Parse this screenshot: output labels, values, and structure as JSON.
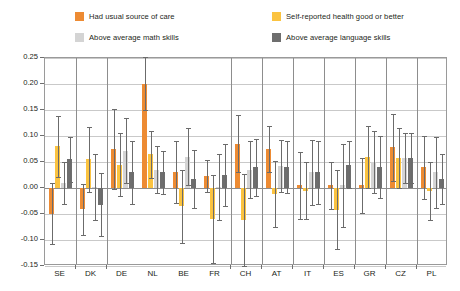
{
  "legend": {
    "rows": [
      [
        {
          "label": "Had usual source of care",
          "color": "#ED8B33",
          "icon": "legend-swatch-orange"
        },
        {
          "label": "Self-reported health good or better",
          "color": "#FBC340",
          "icon": "legend-swatch-yellow"
        }
      ],
      [
        {
          "label": "Above average math skills",
          "color": "#D4D4D4",
          "icon": "legend-swatch-light-gray"
        },
        {
          "label": "Above average language skills",
          "color": "#6E6E6E",
          "icon": "legend-swatch-dark-gray"
        }
      ]
    ]
  },
  "chart_data": {
    "type": "bar",
    "title": "",
    "subtitle": "",
    "xlabel": "",
    "ylabel": "",
    "ylim": [
      -0.15,
      0.25
    ],
    "yticks": [
      "0.25",
      "0.20",
      "0.15",
      "0.10",
      "0.05",
      "0.00",
      "-0.05",
      "-0.10",
      "-0.15"
    ],
    "ytick_values": [
      0.25,
      0.2,
      0.15,
      0.1,
      0.05,
      0.0,
      -0.05,
      -0.1,
      -0.15
    ],
    "grid": true,
    "legend_position": "above-plot",
    "error_bars": "95% confidence interval",
    "categories": [
      "SE",
      "DK",
      "DE",
      "NL",
      "BE",
      "FR",
      "CH",
      "AT",
      "IT",
      "ES",
      "GR",
      "CZ",
      "PL"
    ],
    "group_separators_after": [
      "SE",
      "DK",
      "FR",
      "CH",
      "AT",
      "IT",
      "ES",
      "GR",
      "CZ"
    ],
    "series": [
      {
        "name": "Had usual source of care",
        "color": "#ED8B33",
        "values": [
          -0.05,
          -0.04,
          0.075,
          0.2,
          0.03,
          0.023,
          0.085,
          0.075,
          0.005,
          0.005,
          0.005,
          0.078,
          0.04
        ],
        "ci_low": [
          -0.108,
          -0.09,
          -0.002,
          0.15,
          -0.028,
          -0.007,
          0.03,
          0.03,
          -0.06,
          -0.04,
          -0.048,
          0.013,
          -0.022
        ],
        "ci_high": [
          0.01,
          0.008,
          0.152,
          0.252,
          0.09,
          0.053,
          0.14,
          0.12,
          0.07,
          0.05,
          0.058,
          0.143,
          0.1
        ]
      },
      {
        "name": "Self-reported health good or better",
        "color": "#FBC340",
        "values": [
          0.08,
          0.055,
          0.045,
          0.065,
          -0.035,
          -0.06,
          -0.062,
          -0.012,
          -0.005,
          -0.042,
          0.06,
          0.058,
          -0.006
        ],
        "ci_low": [
          0.022,
          -0.008,
          -0.015,
          0.02,
          -0.105,
          -0.145,
          -0.15,
          -0.075,
          -0.06,
          -0.118,
          0.0,
          0.0,
          -0.062
        ],
        "ci_high": [
          0.138,
          0.118,
          0.105,
          0.11,
          0.035,
          0.025,
          0.026,
          0.051,
          0.05,
          0.034,
          0.12,
          0.116,
          0.05
        ]
      },
      {
        "name": "Above average math skills",
        "color": "#D4D4D4",
        "values": [
          0.01,
          0.002,
          0.072,
          0.035,
          0.06,
          0.002,
          0.035,
          0.042,
          0.03,
          0.005,
          0.05,
          0.058,
          0.03
        ],
        "ci_low": [
          -0.03,
          -0.062,
          0.01,
          -0.01,
          0.005,
          -0.062,
          -0.02,
          -0.008,
          -0.032,
          -0.075,
          -0.01,
          0.01,
          -0.038
        ],
        "ci_high": [
          0.05,
          0.066,
          0.134,
          0.08,
          0.115,
          0.066,
          0.09,
          0.092,
          0.092,
          0.085,
          0.11,
          0.106,
          0.098
        ]
      },
      {
        "name": "Above average language skills",
        "color": "#6E6E6E",
        "values": [
          0.055,
          -0.032,
          0.03,
          0.03,
          0.018,
          0.025,
          0.04,
          0.04,
          0.03,
          0.045,
          0.04,
          0.058,
          0.018
        ],
        "ci_low": [
          0.012,
          -0.092,
          -0.03,
          -0.012,
          -0.038,
          -0.035,
          -0.015,
          -0.01,
          -0.03,
          0.0,
          -0.02,
          0.01,
          -0.03
        ],
        "ci_high": [
          0.098,
          0.028,
          0.09,
          0.072,
          0.074,
          0.085,
          0.095,
          0.09,
          0.09,
          0.09,
          0.1,
          0.106,
          0.066
        ]
      }
    ]
  }
}
